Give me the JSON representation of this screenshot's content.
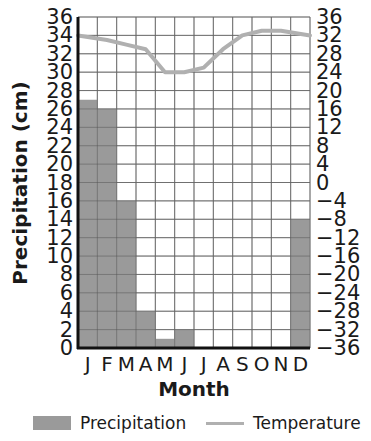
{
  "chart_data": {
    "type": "bar+line",
    "title": "",
    "xlabel": "Month",
    "ylabel": "Precipitation (cm)",
    "ylabel_right": "",
    "categories": [
      "J",
      "F",
      "M",
      "A",
      "M",
      "J",
      "J",
      "A",
      "S",
      "O",
      "N",
      "D"
    ],
    "series": [
      {
        "name": "Precipitation",
        "type": "bar",
        "axis": "left",
        "color": "#9a9a9a",
        "values": [
          27,
          26,
          16,
          4,
          1,
          2,
          0,
          0,
          0,
          0,
          0,
          14
        ]
      },
      {
        "name": "Temperature",
        "type": "line",
        "axis": "right",
        "color": "#b0b0b0",
        "values": [
          32,
          31,
          30,
          29,
          24,
          24,
          25,
          29,
          32,
          33,
          33,
          32
        ]
      }
    ],
    "left_axis": {
      "ylim": [
        0,
        36
      ],
      "ticks": [
        36,
        34,
        32,
        30,
        28,
        26,
        24,
        22,
        20,
        18,
        16,
        14,
        12,
        10,
        8,
        6,
        4,
        2,
        0
      ]
    },
    "right_axis": {
      "ylim": [
        -36,
        36
      ],
      "ticks": [
        36,
        32,
        28,
        24,
        20,
        16,
        12,
        8,
        4,
        0,
        -4,
        -8,
        -12,
        -16,
        -20,
        -24,
        -28,
        -32,
        -36
      ]
    },
    "grid": true,
    "legend_position": "bottom"
  },
  "legend": {
    "precipitation_label": "Precipitation",
    "temperature_label": "Temperature"
  }
}
